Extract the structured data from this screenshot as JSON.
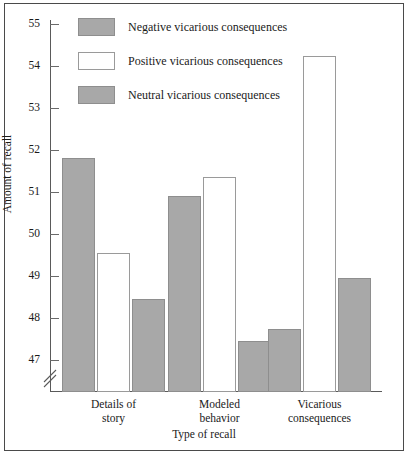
{
  "chart_data": {
    "type": "bar",
    "title": "",
    "xlabel": "Type of recall",
    "ylabel": "Amount of recall",
    "categories": [
      "Details of story",
      "Modeled behavior",
      "Vicarious consequences"
    ],
    "category_lines": [
      [
        "Details of",
        "story"
      ],
      [
        "Modeled",
        "behavior"
      ],
      [
        "Vicarious",
        "consequences"
      ]
    ],
    "series": [
      {
        "name": "Negative vicarious consequences",
        "style": "solid",
        "values": [
          51.8,
          50.9,
          47.75
        ]
      },
      {
        "name": "Positive vicarious consequences",
        "style": "hollow",
        "values": [
          49.55,
          51.35,
          54.25
        ]
      },
      {
        "name": "Neutral vicarious consequences",
        "style": "solid",
        "values": [
          48.45,
          47.45,
          48.95
        ]
      }
    ],
    "ylim": [
      46.6,
      55
    ],
    "yticks": [
      47,
      48,
      49,
      50,
      51,
      52,
      53,
      54,
      55
    ],
    "ytick_labels": [
      "47",
      "48",
      "49",
      "50",
      "51",
      "52",
      "53",
      "54",
      "55"
    ],
    "axis_break": true,
    "grid": false,
    "legend_position": "top-left",
    "colors": {
      "bar_solid_fill": "#a8a8a8",
      "bar_solid_border": "#8e8e8e",
      "bar_hollow_fill": "#ffffff",
      "bar_hollow_border": "#9a9a9a",
      "axis": "#5a5a5a",
      "text": "#1a1a1a",
      "frame": "#4a4a4a"
    }
  },
  "legend": {
    "items": [
      {
        "label": "Negative vicarious consequences",
        "style": "solid"
      },
      {
        "label": "Positive vicarious consequences",
        "style": "hollow"
      },
      {
        "label": "Neutral vicarious consequences",
        "style": "solid"
      }
    ]
  }
}
